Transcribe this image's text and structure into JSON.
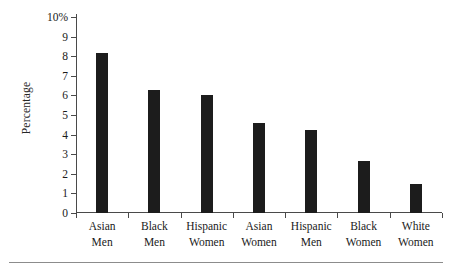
{
  "chart_data": {
    "type": "bar",
    "title": "",
    "xlabel": "",
    "ylabel": "Percentage",
    "categories": [
      "Asian Men",
      "Black Men",
      "Hispanic Women",
      "Asian Women",
      "Hispanic Men",
      "Black Women",
      "White Women"
    ],
    "category_lines": [
      [
        "Asian",
        "Men"
      ],
      [
        "Black",
        "Men"
      ],
      [
        "Hispanic",
        "Women"
      ],
      [
        "Asian",
        "Women"
      ],
      [
        "Hispanic",
        "Men"
      ],
      [
        "Black",
        "Women"
      ],
      [
        "White",
        "Women"
      ]
    ],
    "values": [
      8.15,
      6.3,
      6.0,
      4.6,
      4.25,
      2.65,
      1.5
    ],
    "ylim": [
      0,
      10
    ],
    "ytick_values": [
      0,
      1,
      2,
      3,
      4,
      5,
      6,
      7,
      8,
      9,
      10
    ],
    "ytick_labels": [
      "0",
      "1",
      "2",
      "3",
      "4",
      "5",
      "6",
      "7",
      "8",
      "9",
      "10%"
    ],
    "grid": false,
    "legend": null,
    "bar_color": "#1c1c1c",
    "axis_color": "#4a4a4a"
  }
}
